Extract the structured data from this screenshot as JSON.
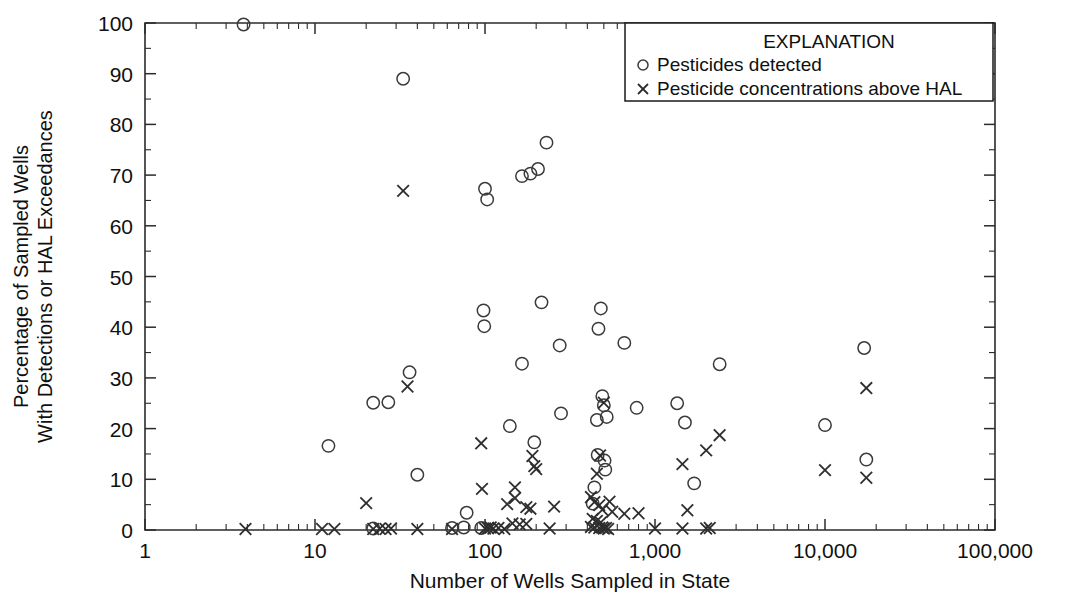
{
  "chart_data": {
    "type": "scatter",
    "title": "",
    "xlabel": "Number of Wells Sampled in State",
    "ylabel_line1": "Percentage of Sampled Wells",
    "ylabel_line2": "With Detections or HAL Exceedances",
    "xscale": "log",
    "yscale": "linear",
    "xlim": [
      1,
      100000
    ],
    "ylim": [
      0,
      100
    ],
    "grid": false,
    "xticks": [
      1,
      10,
      100,
      1000,
      10000,
      100000
    ],
    "xtick_labels": [
      "1",
      "10",
      "100",
      "1,000",
      "10,000",
      "100,000"
    ],
    "yticks": [
      0,
      10,
      20,
      30,
      40,
      50,
      60,
      70,
      80,
      90,
      100
    ],
    "ytick_labels": [
      "0",
      "10",
      "20",
      "30",
      "40",
      "50",
      "60",
      "70",
      "80",
      "90",
      "100"
    ],
    "y_minor_step": 5,
    "legend": {
      "position": "top-right",
      "title": "EXPLANATION",
      "entries": [
        {
          "marker": "circle",
          "label": "Pesticides detected"
        },
        {
          "marker": "x",
          "label": "Pesticide concentrations above HAL"
        }
      ]
    },
    "series": [
      {
        "name": "Pesticides detected",
        "marker": "circle",
        "color": "#3a3a3a",
        "points": [
          [
            3.8,
            99.7
          ],
          [
            33,
            89.0
          ],
          [
            230,
            76.4
          ],
          [
            165,
            69.8
          ],
          [
            185,
            70.3
          ],
          [
            205,
            71.2
          ],
          [
            100,
            67.3
          ],
          [
            103,
            65.2
          ],
          [
            215,
            44.9
          ],
          [
            98,
            43.3
          ],
          [
            99,
            40.2
          ],
          [
            480,
            43.7
          ],
          [
            660,
            36.9
          ],
          [
            275,
            36.4
          ],
          [
            465,
            39.7
          ],
          [
            17000,
            35.9
          ],
          [
            2400,
            32.7
          ],
          [
            36,
            31.1
          ],
          [
            165,
            32.8
          ],
          [
            22,
            25.1
          ],
          [
            27,
            25.2
          ],
          [
            490,
            26.4
          ],
          [
            500,
            24.6
          ],
          [
            520,
            22.3
          ],
          [
            455,
            21.7
          ],
          [
            780,
            24.1
          ],
          [
            1350,
            25.0
          ],
          [
            1500,
            21.2
          ],
          [
            10000,
            20.7
          ],
          [
            140,
            20.5
          ],
          [
            280,
            23.0
          ],
          [
            12,
            16.6
          ],
          [
            195,
            17.3
          ],
          [
            460,
            14.8
          ],
          [
            505,
            13.7
          ],
          [
            510,
            11.9
          ],
          [
            1700,
            9.2
          ],
          [
            17500,
            13.9
          ],
          [
            40,
            10.9
          ],
          [
            440,
            8.4
          ],
          [
            78,
            3.4
          ],
          [
            430,
            5.2
          ],
          [
            75,
            0.5
          ],
          [
            95,
            0.4
          ],
          [
            22,
            0.3
          ],
          [
            64,
            0.4
          ]
        ]
      },
      {
        "name": "Pesticide concentrations above HAL",
        "marker": "x",
        "color": "#2e2e2e",
        "points": [
          [
            33,
            66.9
          ],
          [
            35,
            28.3
          ],
          [
            17500,
            28.0
          ],
          [
            500,
            25.1
          ],
          [
            2400,
            18.7
          ],
          [
            95,
            17.1
          ],
          [
            1450,
            13.0
          ],
          [
            2000,
            15.7
          ],
          [
            10000,
            11.8
          ],
          [
            17500,
            10.3
          ],
          [
            190,
            14.6
          ],
          [
            195,
            12.6
          ],
          [
            200,
            12.0
          ],
          [
            475,
            14.7
          ],
          [
            455,
            11.1
          ],
          [
            150,
            8.4
          ],
          [
            96,
            8.1
          ],
          [
            150,
            6.3
          ],
          [
            20,
            5.3
          ],
          [
            135,
            5.1
          ],
          [
            175,
            4.5
          ],
          [
            185,
            4.2
          ],
          [
            255,
            4.6
          ],
          [
            420,
            6.5
          ],
          [
            440,
            5.5
          ],
          [
            470,
            4.9
          ],
          [
            490,
            4.0
          ],
          [
            540,
            5.6
          ],
          [
            560,
            3.6
          ],
          [
            660,
            3.2
          ],
          [
            800,
            3.3
          ],
          [
            1550,
            3.9
          ],
          [
            430,
            2.2
          ],
          [
            455,
            1.8
          ],
          [
            480,
            1.5
          ],
          [
            145,
            1.3
          ],
          [
            160,
            1.1
          ],
          [
            175,
            1.2
          ],
          [
            3.9,
            0.2
          ],
          [
            11,
            0.2
          ],
          [
            13,
            0.2
          ],
          [
            22,
            0.2
          ],
          [
            24,
            0.25
          ],
          [
            26,
            0.2
          ],
          [
            28,
            0.3
          ],
          [
            40,
            0.2
          ],
          [
            64,
            0.2
          ],
          [
            100,
            0.3
          ],
          [
            104,
            0.4
          ],
          [
            108,
            0.5
          ],
          [
            112,
            0.3
          ],
          [
            120,
            0.4
          ],
          [
            130,
            0.2
          ],
          [
            240,
            0.3
          ],
          [
            420,
            0.6
          ],
          [
            440,
            0.5
          ],
          [
            470,
            0.4
          ],
          [
            490,
            0.5
          ],
          [
            500,
            0.3
          ],
          [
            515,
            0.4
          ],
          [
            530,
            0.2
          ],
          [
            1000,
            0.3
          ],
          [
            1450,
            0.3
          ],
          [
            2000,
            0.3
          ],
          [
            2100,
            0.4
          ]
        ]
      }
    ]
  }
}
